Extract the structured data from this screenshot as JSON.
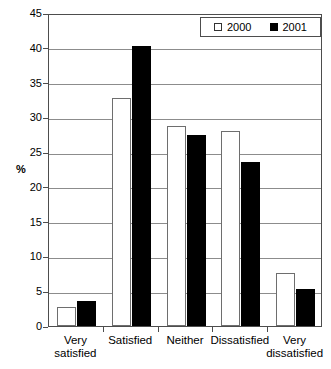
{
  "chart_data": {
    "type": "bar",
    "title": "",
    "subtitle": "",
    "xlabel": "",
    "ylabel": "%",
    "ylim": [
      0,
      45
    ],
    "ytick_step": 5,
    "yticks": [
      45,
      40,
      35,
      30,
      25,
      20,
      15,
      10,
      5,
      0
    ],
    "grid": true,
    "grid_axis": "y",
    "legend_position": "top-right",
    "categories": [
      "Very\nsatisfied",
      "Satisfied",
      "Neither",
      "Dissatisfied",
      "Very\ndissatisfied"
    ],
    "series": [
      {
        "name": "2000",
        "color": "#ffffff",
        "edge_color": "#6e6e6e",
        "swatch": "hollow",
        "values": [
          2.7,
          32.8,
          28.8,
          28.1,
          7.6
        ]
      },
      {
        "name": "2001",
        "color": "#000000",
        "edge_color": "#000000",
        "swatch": "solid",
        "values": [
          3.6,
          40.2,
          27.4,
          23.6,
          5.3
        ]
      }
    ]
  },
  "legend": {
    "entries": [
      {
        "label": "2000",
        "swatch": "hollow"
      },
      {
        "label": "2001",
        "swatch": "solid"
      }
    ]
  },
  "axes": {
    "y_title": "%",
    "y_tick_labels": [
      "45",
      "40",
      "35",
      "30",
      "25",
      "20",
      "15",
      "10",
      "5",
      "0"
    ],
    "x_tick_labels": [
      "Very\nsatisfied",
      "Satisfied",
      "Neither",
      "Dissatisfied",
      "Very\ndissatisfied"
    ]
  },
  "colors": {
    "series_2000": "#ffffff",
    "series_2001": "#000000",
    "axis": "#4d4d4d",
    "grid": "#8c8c8c",
    "background": "#ffffff"
  }
}
